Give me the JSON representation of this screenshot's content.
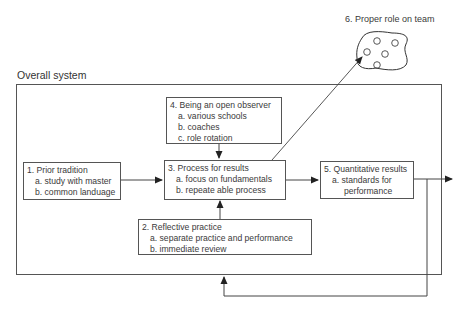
{
  "diagram": {
    "system_label": "Overall system",
    "boxes": {
      "prior_tradition": {
        "title": "1. Prior tradition",
        "items": [
          "a. study with master",
          "b. common landuage"
        ]
      },
      "reflective_practice": {
        "title": "2. Reflective practice",
        "items": [
          "a. separate practice and performance",
          "b. immediate review"
        ]
      },
      "process_for_results": {
        "title": "3. Process for results",
        "items": [
          "a. focus on fundamentals",
          "b. repeate able process"
        ]
      },
      "open_observer": {
        "title": "4. Being an open observer",
        "items": [
          "a. various schools",
          "b. coaches",
          "c. role rotation"
        ]
      },
      "quantitative_results": {
        "title": "5. Quantitative results",
        "items": [
          "a. standards for",
          "performance"
        ]
      }
    },
    "team": {
      "label": "6. Proper role on team"
    },
    "edges": [
      {
        "from": "1. Prior tradition",
        "to": "3. Process for results"
      },
      {
        "from": "4. Being an open observer",
        "to": "3. Process for results"
      },
      {
        "from": "2. Reflective practice",
        "to": "3. Process for results"
      },
      {
        "from": "3. Process for results",
        "to": "5. Quantitative results"
      },
      {
        "from": "3. Process for results",
        "to": "6. Proper role on team"
      },
      {
        "from": "5. Quantitative results",
        "to": "output"
      },
      {
        "from": "5. Quantitative results",
        "to": "Overall system (feedback)"
      }
    ],
    "colors": {
      "stroke": "#555555",
      "text": "#3a3a3a"
    }
  }
}
